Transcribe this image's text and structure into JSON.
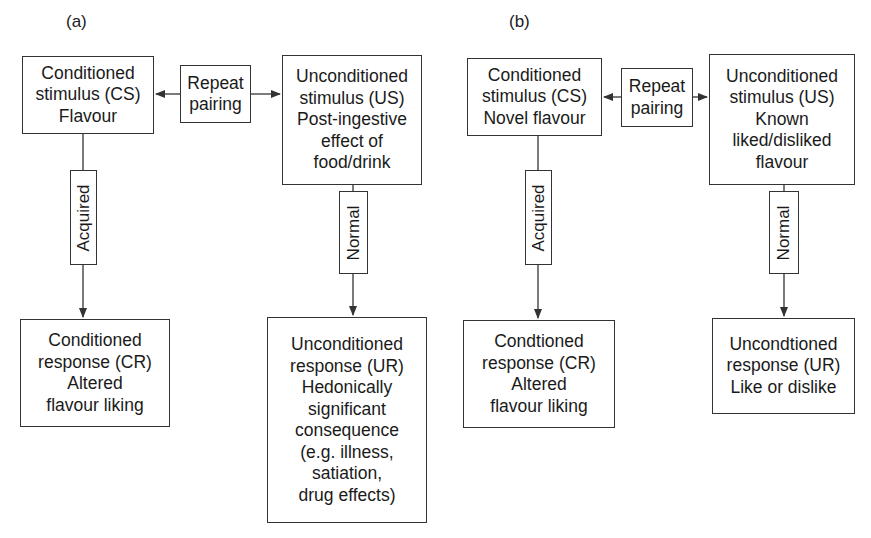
{
  "panels": [
    {
      "label": "(a)",
      "cs": "Conditioned\nstimulus (CS)\nFlavour",
      "pairing": "Repeat\npairing",
      "us": "Unconditioned\nstimulus (US)\nPost-ingestive\neffect of\nfood/drink",
      "acquired": "Acquired",
      "normal": "Normal",
      "cr": "Conditioned\nresponse (CR)\nAltered\nflavour liking",
      "ur": "Unconditioned\nresponse (UR)\nHedonically\nsignificant\nconsequence\n(e.g. illness,\nsatiation,\ndrug effects)"
    },
    {
      "label": "(b)",
      "cs": "Conditioned\nstimulus (CS)\nNovel flavour",
      "pairing": "Repeat\npairing",
      "us": "Unconditioned\nstimulus (US)\nKnown\nliked/disliked\nflavour",
      "acquired": "Acquired",
      "normal": "Normal",
      "cr": "Condtioned\nresponse (CR)\nAltered\nflavour liking",
      "ur": "Uncondtioned\nresponse (UR)\nLike or dislike"
    }
  ],
  "colors": {
    "stroke": "#333333",
    "text": "#1a1a1a",
    "background": "#ffffff"
  }
}
